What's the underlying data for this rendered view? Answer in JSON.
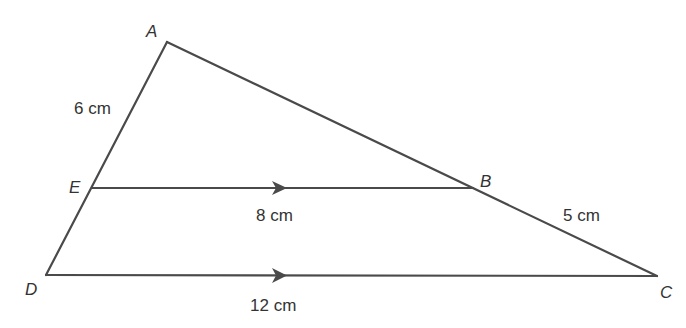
{
  "diagram": {
    "stroke_color": "#4a4a4a",
    "vertices": {
      "A": {
        "label": "A",
        "x": 167,
        "y": 42
      },
      "B": {
        "label": "B",
        "x": 473,
        "y": 188
      },
      "C": {
        "label": "C",
        "x": 657,
        "y": 276
      },
      "D": {
        "label": "D",
        "x": 46,
        "y": 275
      },
      "E": {
        "label": "E",
        "x": 92,
        "y": 188
      }
    },
    "segments": [
      {
        "from": "A",
        "to": "C"
      },
      {
        "from": "A",
        "to": "D"
      },
      {
        "from": "E",
        "to": "B",
        "parallel_mark": true
      },
      {
        "from": "D",
        "to": "C",
        "parallel_mark": true
      }
    ],
    "measurements": {
      "AE": "6 cm",
      "EB": "8 cm",
      "BC": "5 cm",
      "DC": "12 cm"
    }
  }
}
